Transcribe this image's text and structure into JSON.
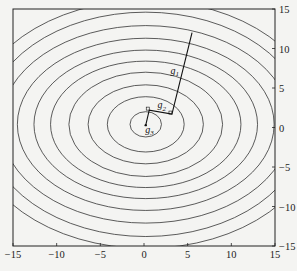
{
  "chart_data": {
    "type": "contour",
    "title": "",
    "xlabel": "",
    "ylabel": "",
    "xlim": [
      -15,
      15
    ],
    "ylim": [
      -15,
      15
    ],
    "x_ticks": [
      -15,
      -10,
      -5,
      0,
      5,
      10,
      15
    ],
    "y_ticks": [
      15,
      10,
      5,
      0,
      -5,
      -10,
      -15
    ],
    "y_axis_side": "right",
    "grid": false,
    "contours": {
      "center": [
        0.2,
        0.4
      ],
      "count": 10,
      "semi_axes": [
        [
          1.8,
          1.6
        ],
        [
          4.4,
          3.5
        ],
        [
          6.6,
          5.0
        ],
        [
          8.8,
          6.6
        ],
        [
          10.9,
          8.0
        ],
        [
          12.8,
          9.4
        ],
        [
          14.7,
          10.9
        ],
        [
          16.6,
          12.5
        ],
        [
          18.3,
          14.2
        ],
        [
          20.0,
          15.7
        ]
      ]
    },
    "path": {
      "points": [
        [
          5.5,
          12.0
        ],
        [
          3.2,
          1.7
        ],
        [
          0.6,
          2.2
        ],
        [
          0.2,
          0.3
        ]
      ],
      "labels": [
        {
          "text": "g",
          "sub": "1",
          "x": 3.5,
          "y": 7.2
        },
        {
          "text": "g",
          "sub": "2",
          "x": 2.0,
          "y": 2.8
        },
        {
          "text": "g",
          "sub": "3",
          "x": 0.6,
          "y": -0.3
        }
      ]
    }
  },
  "colors": {
    "line": "#333333",
    "axis": "#222222",
    "background": "#f4f4f2"
  }
}
